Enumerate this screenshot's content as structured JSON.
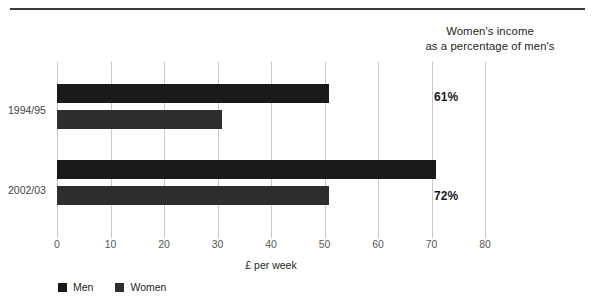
{
  "header": {
    "caption_line1": "Women's income",
    "caption_line2": "as a percentage of men's"
  },
  "annotations": [
    {
      "label": "61%",
      "top": 90
    },
    {
      "label": "72%",
      "top": 189
    }
  ],
  "legend": {
    "items": [
      {
        "label": "Men",
        "color": "#1a1a1a",
        "icon": "square-swatch"
      },
      {
        "label": "Women",
        "color": "#2e2e2e",
        "icon": "square-swatch"
      }
    ]
  },
  "chart_data": {
    "type": "bar",
    "orientation": "horizontal",
    "title": "",
    "subtitle": "",
    "categories": [
      "1994/95",
      "2002/03"
    ],
    "series": [
      {
        "name": "Men",
        "values": [
          50.8,
          70.8
        ],
        "color": "#1a1a1a"
      },
      {
        "name": "Women",
        "values": [
          30.8,
          50.8
        ],
        "color": "#2e2e2e"
      }
    ],
    "xlabel": "£ per week",
    "ylabel": "",
    "xlim": [
      0,
      80
    ],
    "xticks": [
      0,
      10,
      20,
      30,
      40,
      50,
      60,
      70,
      80
    ],
    "xtick_labels": [
      "0",
      "10",
      "20",
      "30",
      "40",
      "50",
      "60",
      "70",
      "80"
    ],
    "grid": "vertical",
    "legend_position": "bottom-left",
    "annotations": [
      "61%",
      "72%"
    ],
    "annotation_note": "Women's income as a percentage of men's"
  },
  "geometry": {
    "bars": [
      {
        "name": "men-1994-95",
        "series": "Men",
        "category": "1994/95",
        "top": 84,
        "height": 19,
        "value": 50.8
      },
      {
        "name": "women-1994-95",
        "series": "Women",
        "category": "1994/95",
        "top": 110,
        "height": 19,
        "value": 30.8
      },
      {
        "name": "men-2002-03",
        "series": "Men",
        "category": "2002/03",
        "top": 160,
        "height": 19,
        "value": 70.8
      },
      {
        "name": "women-2002-03",
        "series": "Women",
        "category": "2002/03",
        "top": 186,
        "height": 19,
        "value": 50.8
      }
    ],
    "ylabels": [
      {
        "label": "1994/95",
        "top": 104
      },
      {
        "label": "2002/03",
        "top": 184
      }
    ]
  }
}
